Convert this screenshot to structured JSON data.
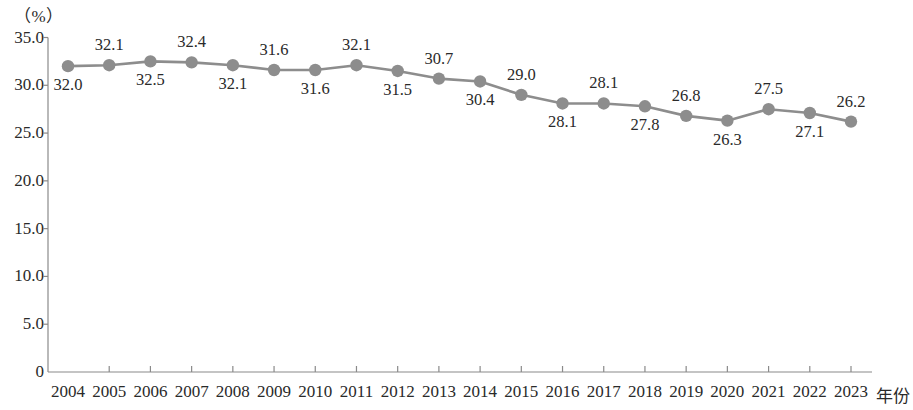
{
  "chart_data": {
    "type": "line",
    "title": "",
    "xlabel": "年份",
    "ylabel": "（%）",
    "unit_label": "（%）",
    "x_axis_name": "年份",
    "categories": [
      "2004",
      "2005",
      "2006",
      "2007",
      "2008",
      "2009",
      "2010",
      "2011",
      "2012",
      "2013",
      "2014",
      "2015",
      "2016",
      "2017",
      "2018",
      "2019",
      "2020",
      "2021",
      "2022",
      "2023"
    ],
    "values": [
      32.0,
      32.1,
      32.5,
      32.4,
      32.1,
      31.6,
      31.6,
      32.1,
      31.5,
      30.7,
      30.4,
      29.0,
      28.1,
      28.1,
      27.8,
      26.8,
      26.3,
      27.5,
      27.1,
      26.2
    ],
    "point_labels": [
      "32.0",
      "32.1",
      "32.5",
      "32.4",
      "32.1",
      "31.6",
      "31.6",
      "32.1",
      "31.5",
      "30.7",
      "30.4",
      "29.0",
      "28.1",
      "28.1",
      "27.8",
      "26.8",
      "26.3",
      "27.5",
      "27.1",
      "26.2"
    ],
    "label_positions": [
      "below",
      "above",
      "below",
      "above",
      "below",
      "above",
      "below",
      "above",
      "below",
      "above",
      "below",
      "above",
      "below",
      "above",
      "below",
      "above",
      "below",
      "above",
      "below",
      "above"
    ],
    "ylim": [
      0,
      35
    ],
    "y_ticks": [
      0,
      5,
      10,
      15,
      20,
      25,
      30,
      35
    ],
    "y_tick_labels": [
      "0",
      "5.0",
      "10.0",
      "15.0",
      "20.0",
      "25.0",
      "30.0",
      "35.0"
    ],
    "grid": false,
    "legend": "none",
    "series_color": "#8d8d8d",
    "marker_color": "#8d8d8d",
    "axis_color": "#8a8a8a"
  }
}
